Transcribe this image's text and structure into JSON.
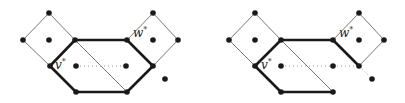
{
  "figure": {
    "panels": [
      {
        "name": "left",
        "label_v": "v",
        "label_w": "w",
        "superscript": "*"
      },
      {
        "name": "right",
        "label_v": "v",
        "label_w": "w",
        "superscript": "*"
      }
    ]
  },
  "colors": {
    "background": "#ffffff",
    "node": "#1a1a1a",
    "thick_edge": "#1a1a1a",
    "thin_edge": "#555555",
    "dotted_edge": "#9a9a9a"
  }
}
